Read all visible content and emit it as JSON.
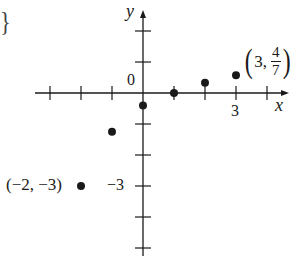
{
  "chart_data": {
    "type": "scatter",
    "title": "",
    "xlabel": "x",
    "ylabel": "y",
    "xlim": [
      -3.5,
      4.5
    ],
    "ylim": [
      -5,
      3
    ],
    "grid": false,
    "tick_spacing": 1,
    "labeled_ticks": {
      "x": [
        "3"
      ],
      "y": [
        "-3"
      ],
      "origin": "0"
    },
    "points": [
      {
        "x": -2,
        "y": -3
      },
      {
        "x": -1,
        "y": -1.25
      },
      {
        "x": 0,
        "y": -0.4
      },
      {
        "x": 1,
        "y": 0
      },
      {
        "x": 2,
        "y": 0.33
      },
      {
        "x": 3,
        "y": 0.571
      }
    ],
    "annotations": [
      {
        "text": "(−2, −3)",
        "x": -2,
        "y": -3
      },
      {
        "text": "(3, 4/7)",
        "x": 3,
        "y": 0.571
      }
    ]
  },
  "labels": {
    "x_axis": "x",
    "y_axis": "y",
    "origin": "0",
    "tick_x3": "3",
    "tick_y_neg3": "−3",
    "point_neg2_label": "(−2, −3)",
    "point_3_open": "(",
    "point_3_x": "3,",
    "point_3_num": "4",
    "point_3_den": "7",
    "point_3_close": ")",
    "brace": "}"
  },
  "style": {
    "ink": "#1a1a1a",
    "background": "#ffffff"
  }
}
